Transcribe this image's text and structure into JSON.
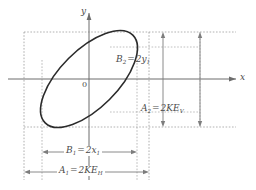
{
  "figure": {
    "axes": {
      "x_label": "x",
      "y_label": "y",
      "origin_label": "0"
    },
    "annotations": {
      "b2": {
        "name": "B2",
        "sub": "2",
        "equals": "=",
        "value": "2y",
        "value_sub": "1"
      },
      "a2": {
        "name": "A2",
        "sub": "2",
        "equals": "=",
        "value": "2KE",
        "value_sub": "V"
      },
      "b1": {
        "name": "B1",
        "sub": "1",
        "equals": "=",
        "value": "2x",
        "value_sub": "1"
      },
      "a1": {
        "name": "A1",
        "sub": "1",
        "equals": "=",
        "value": "2KE",
        "value_sub": "H"
      }
    },
    "colors": {
      "curve": "#2b2b2b",
      "axis": "#6d6d6d",
      "guide": "#a8a8a8",
      "guide_dark": "#8c8c8c",
      "arrow": "#777777",
      "text": "#4a4a4a",
      "background": "#ffffff"
    },
    "geometry": {
      "origin_x": 89,
      "origin_y": 79,
      "ellipse_center_x": 89,
      "ellipse_center_y": 79,
      "ellipse_rx": 60,
      "ellipse_ry": 28,
      "ellipse_rotation_deg": -45,
      "x_axis_from": 8,
      "x_axis_to": 240,
      "y_axis_from": 11,
      "y_axis_to": 180
    }
  }
}
